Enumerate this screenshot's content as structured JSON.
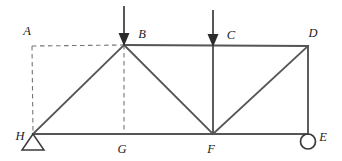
{
  "figure": {
    "type": "truss-diagram",
    "title": "",
    "background_color": "#ffffff",
    "line_color": "#555555",
    "dashed_color": "#777777",
    "label_color": "#1b1b1b",
    "width": 342,
    "height": 161
  },
  "nodes": [
    {
      "id": "A",
      "label": "A",
      "x": 32,
      "y": 46,
      "label_x": 27,
      "label_y": 35,
      "kind": "reference-corner"
    },
    {
      "id": "B",
      "label": "B",
      "x": 124,
      "y": 45,
      "label_x": 142,
      "label_y": 38,
      "kind": "joint-top"
    },
    {
      "id": "C",
      "label": "C",
      "x": 213,
      "y": 46,
      "label_x": 231,
      "label_y": 39,
      "kind": "joint-top"
    },
    {
      "id": "D",
      "label": "D",
      "x": 308,
      "y": 46,
      "label_x": 313,
      "label_y": 37,
      "kind": "joint-top"
    },
    {
      "id": "E",
      "label": "E",
      "x": 308,
      "y": 134,
      "label_x": 321,
      "label_y": 140,
      "kind": "support-roller"
    },
    {
      "id": "F",
      "label": "F",
      "x": 213,
      "y": 134,
      "label_x": 210,
      "label_y": 152,
      "kind": "joint-bottom"
    },
    {
      "id": "G",
      "label": "G",
      "x": 124,
      "y": 134,
      "label_x": 120,
      "label_y": 152,
      "kind": "joint-bottom"
    },
    {
      "id": "H",
      "label": "H",
      "x": 33,
      "y": 134,
      "label_x": 20,
      "label_y": 139,
      "kind": "support-pin"
    }
  ],
  "members": [
    {
      "from": "H",
      "to": "E",
      "style": "solid",
      "name": "bottom-chord-H-E"
    },
    {
      "from": "B",
      "to": "D",
      "style": "solid",
      "name": "top-chord-B-D"
    },
    {
      "from": "H",
      "to": "B",
      "style": "solid",
      "name": "diagonal-H-B"
    },
    {
      "from": "B",
      "to": "F",
      "style": "solid",
      "name": "diagonal-B-F"
    },
    {
      "from": "F",
      "to": "D",
      "style": "solid",
      "name": "diagonal-F-D"
    },
    {
      "from": "C",
      "to": "F",
      "style": "solid",
      "name": "vertical-C-F"
    },
    {
      "from": "D",
      "to": "E",
      "style": "solid",
      "name": "vertical-D-E"
    },
    {
      "from": "A",
      "to": "B",
      "style": "dashed",
      "name": "dashed-A-B"
    },
    {
      "from": "A",
      "to": "H",
      "style": "dashed",
      "name": "dashed-A-H"
    },
    {
      "from": "B",
      "to": "G",
      "style": "dashed",
      "name": "dashed-B-G"
    }
  ],
  "loads": [
    {
      "id": "load-at-B",
      "at": "B",
      "x": 124,
      "tail_y": 6,
      "head_y": 45,
      "direction": "down",
      "label": ""
    },
    {
      "id": "load-at-C",
      "at": "C",
      "x": 213,
      "tail_y": 10,
      "head_y": 46,
      "direction": "down",
      "label": ""
    }
  ],
  "supports": [
    {
      "id": "pin-support-H",
      "at": "H",
      "type": "pin",
      "x": 33,
      "y": 134,
      "half_width": 11,
      "height": 16
    },
    {
      "id": "roller-support-E",
      "at": "E",
      "type": "roller",
      "x": 308,
      "y": 134,
      "radius": 7.5
    }
  ]
}
